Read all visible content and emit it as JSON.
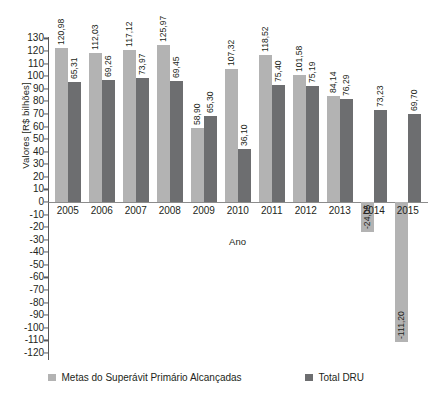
{
  "chart_data": {
    "type": "bar",
    "title": "",
    "subtitle": "",
    "xlabel": "Ano",
    "ylabel": "Valores [R$ bilhões]",
    "categories": [
      "2005",
      "2006",
      "2007",
      "2008",
      "2009",
      "2010",
      "2011",
      "2012",
      "2013",
      "2014",
      "2015"
    ],
    "series": [
      {
        "name": "Metas do Superávit Primário Alcançadas",
        "color": "#b3b3b3",
        "values": [
          120.98,
          112.03,
          117.12,
          125.97,
          58.9,
          107.32,
          118.52,
          101.58,
          84.14,
          -24.05,
          -111.2
        ],
        "labels": [
          "120,98",
          "112,03",
          "117,12",
          "125,97",
          "58,90",
          "107,32",
          "118,52",
          "101,58",
          "84,14",
          "-24,05",
          "-111,20"
        ]
      },
      {
        "name": "Total DRU",
        "color": "#6d6e70",
        "values": [
          65.31,
          69.26,
          73.97,
          69.45,
          65.3,
          36.1,
          75.4,
          75.19,
          76.29,
          73.23,
          69.7
        ],
        "labels": [
          "65,31",
          "69,26",
          "73,97",
          "69,45",
          "65,30",
          "36,10",
          "75,40",
          "75,19",
          "76,29",
          "73,23",
          "69,70"
        ]
      }
    ],
    "ylim": [
      -120,
      130
    ],
    "ytick_step": 10,
    "yticks": [
      130,
      120,
      110,
      100,
      90,
      80,
      70,
      60,
      50,
      40,
      30,
      20,
      10,
      0,
      -10,
      -20,
      -30,
      -40,
      -50,
      -60,
      -70,
      -80,
      -90,
      -100,
      -110,
      -120
    ],
    "ytick_labels": [
      "130",
      "120",
      "110",
      "100",
      "90",
      "80",
      "70",
      "60",
      "50",
      "40",
      "30",
      "20",
      "10",
      "0",
      "-10",
      "-20",
      "-30",
      "-40",
      "-50",
      "-60",
      "-70",
      "-80",
      "-90",
      "-100",
      "-110",
      "-120"
    ],
    "grid": false,
    "legend_position": "bottom",
    "bar_draw_values": {
      "note": "pixel-rendered bar extents as drawn in the source figure",
      "series1": [
        122.5,
        118.5,
        121.0,
        125.0,
        58.5,
        105.5,
        116.5,
        101.0,
        84.0,
        -24.05,
        -111.2
      ],
      "series2": [
        95.0,
        97.0,
        98.5,
        96.5,
        68.5,
        42.0,
        93.0,
        92.5,
        81.5,
        73.23,
        69.7
      ]
    }
  },
  "legend": {
    "items": [
      {
        "label": "Metas do Superávit Primário Alcançadas",
        "color": "#b3b3b3"
      },
      {
        "label": "Total DRU",
        "color": "#6d6e70"
      }
    ]
  }
}
